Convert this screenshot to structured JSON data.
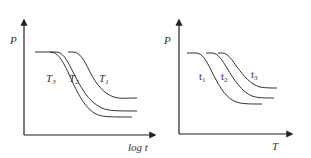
{
  "diagrams": [
    {
      "id": "left",
      "y_axis_label": "P",
      "x_axis_label": "log t",
      "curves": [
        {
          "name": "T3",
          "base": "T",
          "sub": "3"
        },
        {
          "name": "T2",
          "base": "T",
          "sub": "2"
        },
        {
          "name": "T1",
          "base": "T",
          "sub": "1"
        }
      ]
    },
    {
      "id": "right",
      "y_axis_label": "P",
      "x_axis_label": "T",
      "curves": [
        {
          "name": "t1",
          "base": "t",
          "sub": "1"
        },
        {
          "name": "t2",
          "base": "t",
          "sub": "2"
        },
        {
          "name": "t3",
          "base": "t",
          "sub": "3"
        }
      ]
    }
  ]
}
